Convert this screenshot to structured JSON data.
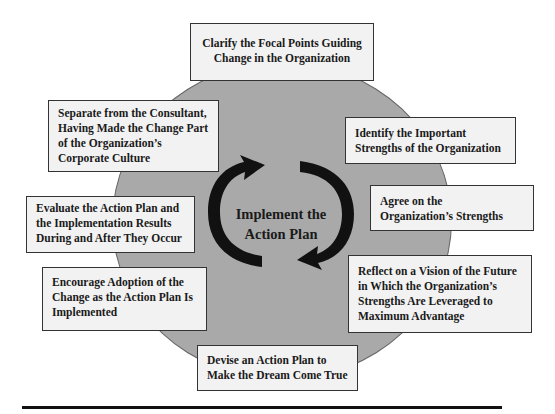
{
  "diagram": {
    "type": "cycle",
    "center": {
      "label_line1": "Implement the",
      "label_line2": "Action Plan"
    },
    "steps": [
      {
        "id": "top",
        "lines": [
          "Clarify the Focal Points Guiding",
          "Change in the Organization"
        ]
      },
      {
        "id": "identify",
        "lines": [
          "Identify the Important",
          "Strengths of the Organization"
        ]
      },
      {
        "id": "agree",
        "lines": [
          "Agree on the",
          "Organization’s Strengths"
        ]
      },
      {
        "id": "reflect",
        "lines": [
          "Reflect on a Vision of the Future",
          "in Which the Organization’s",
          "Strengths Are Leveraged to",
          "Maximum Advantage"
        ]
      },
      {
        "id": "devise",
        "lines": [
          "Devise an Action Plan to",
          "Make the Dream Come True"
        ]
      },
      {
        "id": "encourage",
        "lines": [
          "Encourage Adoption of the",
          "Change as the Action Plan Is",
          "Implemented"
        ]
      },
      {
        "id": "evaluate",
        "lines": [
          "Evaluate the Action Plan and",
          "the Implementation Results",
          "During and After They Occur"
        ]
      },
      {
        "id": "separate",
        "lines": [
          "Separate from the Consultant,",
          "Having Made the Change Part",
          "of the Organization’s",
          "Corporate Culture"
        ]
      }
    ],
    "colors": {
      "circle_fill": "#a9a9a9",
      "box_fill": "#f2f2f2",
      "border": "#333333",
      "arrow": "#111111"
    }
  }
}
